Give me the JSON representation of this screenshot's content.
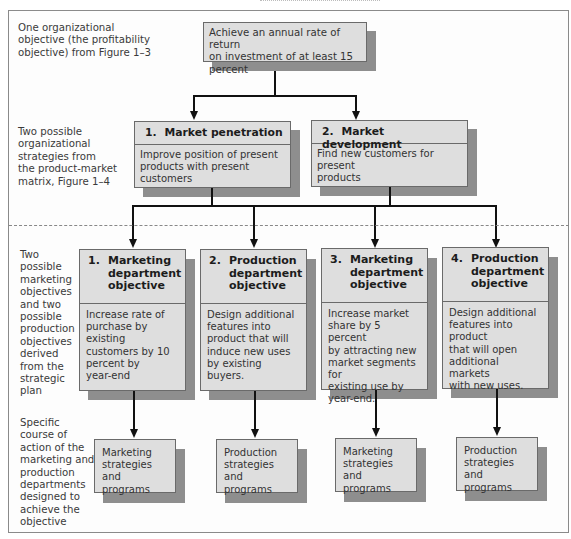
{
  "colors": {
    "box_fill": "#dedede",
    "box_border": "#6a6a6a",
    "shadow": "#8e8e8e",
    "connector": "#111111",
    "divider_dashed": "#888888"
  },
  "row_labels": {
    "level1": "One organizational objective (the profitability objective) from Figure 1–3",
    "level1_lines": [
      "One organizational",
      "objective (the profitability",
      "objective) from Figure 1–3"
    ],
    "level2_lines": [
      "Two possible",
      "organizational",
      "strategies from",
      "the product-market",
      "matrix, Figure 1–4"
    ],
    "level3_lines": [
      "Two",
      "possible",
      "marketing",
      "objectives",
      "and two",
      "possible",
      "production",
      "objectives",
      "derived",
      "from the",
      "strategic",
      "plan"
    ],
    "level4_lines": [
      "Specific",
      "course of",
      "action of the",
      "marketing and",
      "production",
      "departments",
      "designed to",
      "achieve the",
      "objective"
    ]
  },
  "level1": {
    "lines": [
      "Achieve an annual rate of return",
      "on investment of at least 15 percent"
    ]
  },
  "level2": [
    {
      "number": "1.",
      "title": "Market penetration",
      "lines": [
        "Improve position of present",
        "products with present customers"
      ]
    },
    {
      "number": "2.",
      "title": "Market development",
      "lines": [
        "Find new customers for present",
        "products"
      ]
    }
  ],
  "level3": [
    {
      "number": "1.",
      "title_lines": [
        "Marketing",
        "department",
        "objective"
      ],
      "lines": [
        "Increase rate of",
        "purchase by existing",
        "customers by 10",
        "percent by",
        "year-end"
      ]
    },
    {
      "number": "2.",
      "title_lines": [
        "Production",
        "department",
        "objective"
      ],
      "lines": [
        "Design additional",
        "features into",
        "product that will",
        "induce new uses",
        "by existing",
        "buyers."
      ]
    },
    {
      "number": "3.",
      "title_lines": [
        "Marketing",
        "department",
        "objective"
      ],
      "lines": [
        "Increase market",
        "share by 5 percent",
        "by attracting new",
        "market segments for",
        "existing use by",
        "year-end."
      ]
    },
    {
      "number": "4.",
      "title_lines": [
        "Production",
        "department",
        "objective"
      ],
      "lines": [
        "Design additional",
        "features into product",
        "that will open",
        "additional markets",
        "with new uses."
      ]
    }
  ],
  "level4": [
    {
      "lines": [
        "Marketing",
        "strategies and",
        "programs"
      ]
    },
    {
      "lines": [
        "Production",
        "strategies and",
        "programs"
      ]
    },
    {
      "lines": [
        "Marketing",
        "strategies and",
        "programs"
      ]
    },
    {
      "lines": [
        "Production",
        "strategies and",
        "programs"
      ]
    }
  ]
}
